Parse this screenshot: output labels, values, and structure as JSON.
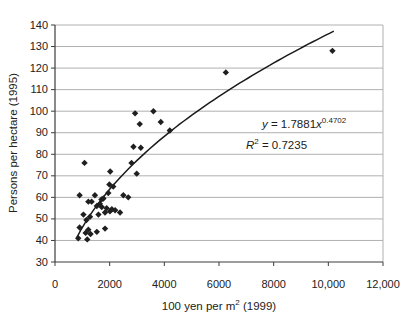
{
  "chart_data": {
    "type": "scatter",
    "title": "",
    "xlabel": "100 yen per m² (1999)",
    "xlabel_parts": {
      "pre": "100 yen per m",
      "sup": "2",
      "post": " (1999)"
    },
    "ylabel": "Persons per hectare (1995)",
    "xlim": [
      0,
      12000
    ],
    "ylim": [
      30,
      140
    ],
    "xticks": [
      0,
      2000,
      4000,
      6000,
      8000,
      10000,
      12000
    ],
    "xtick_labels": [
      "0",
      "2000",
      "4000",
      "6000",
      "8000",
      "10,000",
      "12,000"
    ],
    "yticks": [
      30,
      40,
      50,
      60,
      70,
      80,
      90,
      100,
      110,
      120,
      130,
      140
    ],
    "ytick_labels": [
      "30",
      "40",
      "50",
      "60",
      "70",
      "80",
      "90",
      "100",
      "110",
      "120",
      "130",
      "140"
    ],
    "grid": "horizontal",
    "legend": "none",
    "marker": "diamond",
    "points": [
      [
        850,
        41
      ],
      [
        1120,
        43.5
      ],
      [
        1180,
        40.5
      ],
      [
        1300,
        43
      ],
      [
        900,
        46
      ],
      [
        1220,
        45
      ],
      [
        1530,
        44
      ],
      [
        1830,
        45.5
      ],
      [
        1040,
        52
      ],
      [
        1150,
        49.5
      ],
      [
        1280,
        51
      ],
      [
        1590,
        52
      ],
      [
        1530,
        56
      ],
      [
        1640,
        57
      ],
      [
        1710,
        55.5
      ],
      [
        1830,
        53
      ],
      [
        1890,
        55
      ],
      [
        2010,
        53.5
      ],
      [
        2080,
        54.5
      ],
      [
        2200,
        54
      ],
      [
        2380,
        53
      ],
      [
        900,
        61
      ],
      [
        1220,
        58
      ],
      [
        1340,
        58
      ],
      [
        1460,
        61
      ],
      [
        1700,
        59
      ],
      [
        1770,
        59.5
      ],
      [
        1950,
        62
      ],
      [
        2500,
        61
      ],
      [
        2680,
        60
      ],
      [
        1990,
        66
      ],
      [
        2130,
        65
      ],
      [
        2020,
        72
      ],
      [
        2990,
        71
      ],
      [
        1080,
        76
      ],
      [
        2800,
        76
      ],
      [
        2870,
        83.5
      ],
      [
        3140,
        83
      ],
      [
        3100,
        94
      ],
      [
        3870,
        95
      ],
      [
        4200,
        91
      ],
      [
        2930,
        99
      ],
      [
        3600,
        100
      ],
      [
        6250,
        118
      ],
      [
        10150,
        128
      ]
    ],
    "trendline": {
      "type": "power",
      "equation": "y = 1.7881x^0.4702",
      "a": 1.7881,
      "b": 0.4702,
      "r_squared": 0.7235,
      "x_start": 800,
      "x_end": 10200
    },
    "annotation": {
      "eq_lhs": "y",
      "eq_mid": " = 1.7881",
      "eq_x": "x",
      "eq_exp": "0.4702",
      "r2_lhs": "R",
      "r2_sup": "2",
      "r2_rhs": " = 0.7235"
    },
    "colors": {
      "marker": "#1f1f1f",
      "line": "#1a1a1a",
      "grid": "#b0b0b0",
      "axis": "#3c3c3c",
      "text": "#222222",
      "background": "#ffffff"
    }
  }
}
